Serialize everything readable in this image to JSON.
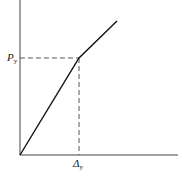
{
  "diagram": {
    "type": "bilinear load-displacement curve",
    "colors": {
      "axis": "#444444",
      "curve": "#111111",
      "dashed": "#555555",
      "background": "#ffffff"
    },
    "labels": {
      "y_yield": {
        "symbol": "P",
        "subscript": "y"
      },
      "x_yield": {
        "symbol": "Δ",
        "subscript": "y"
      }
    },
    "points": {
      "origin": [
        20,
        155
      ],
      "yield": [
        79,
        58
      ],
      "end": [
        117,
        21
      ]
    }
  }
}
